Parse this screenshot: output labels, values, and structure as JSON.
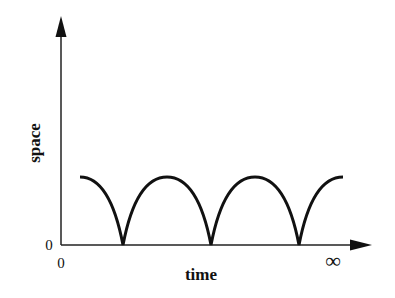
{
  "diagram": {
    "type": "line",
    "x_axis": {
      "label": "time",
      "start_tick": "0",
      "end_tick": "∞"
    },
    "y_axis": {
      "label": "space",
      "origin_tick": "0"
    },
    "curve": {
      "description": "repeated arches touching the time axis at cusps",
      "color": "#111111",
      "cusp_x_pixels": [
        123,
        211,
        299
      ],
      "peak_level": "constant"
    }
  }
}
